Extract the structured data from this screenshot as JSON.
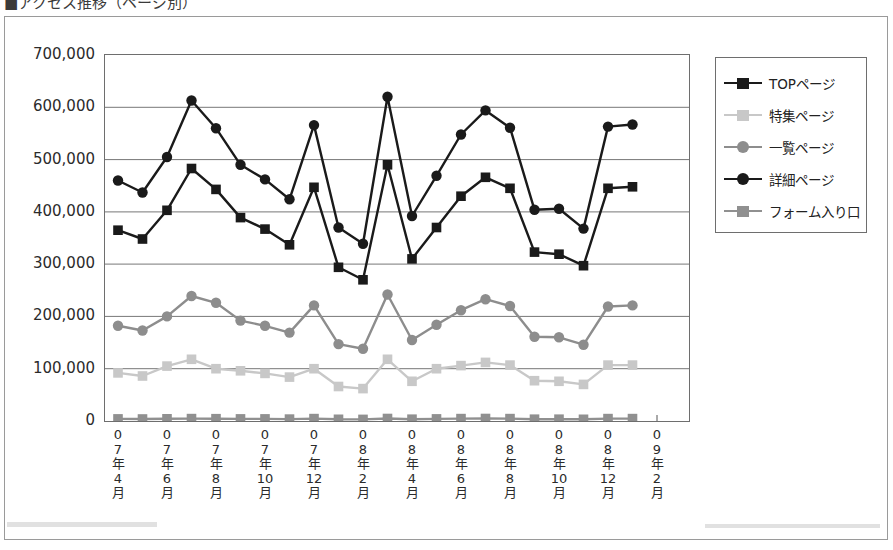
{
  "header": {
    "breadcrumb": "■アクセス推移（ページ別）"
  },
  "legend": {
    "position": "right",
    "items": [
      {
        "label": "TOPページ",
        "color": "#1a1a1a",
        "marker": "square"
      },
      {
        "label": "特集ページ",
        "color": "#c8c8c8",
        "marker": "square"
      },
      {
        "label": "一覧ページ",
        "color": "#8d8d8d",
        "marker": "circle"
      },
      {
        "label": "詳細ページ",
        "color": "#1a1a1a",
        "marker": "circle"
      },
      {
        "label": "フォーム入り口",
        "color": "#909090",
        "marker": "square"
      }
    ]
  },
  "chart_data": {
    "type": "line",
    "title": "",
    "xlabel": "",
    "ylabel": "",
    "ylim": [
      0,
      700000
    ],
    "ytick_step": 100000,
    "yticks": [
      "700,000",
      "600,000",
      "500,000",
      "400,000",
      "300,000",
      "200,000",
      "100,000",
      "0"
    ],
    "grid": true,
    "legend_position": "right",
    "x": [
      "07年4月",
      "07年5月",
      "07年6月",
      "07年7月",
      "07年8月",
      "07年9月",
      "07年10月",
      "07年11月",
      "07年12月",
      "08年1月",
      "08年2月",
      "08年3月",
      "08年4月",
      "08年5月",
      "08年6月",
      "08年7月",
      "08年8月",
      "08年9月",
      "08年10月",
      "08年11月",
      "08年12月",
      "09年1月"
    ],
    "xtick_labels": [
      "07年4月",
      "07年6月",
      "07年8月",
      "07年10月",
      "07年12月",
      "08年2月",
      "08年4月",
      "08年6月",
      "08年8月",
      "08年10月",
      "08年12月",
      "09年2月"
    ],
    "xtick_labels_vertical": [
      [
        "0",
        "7",
        "年",
        "4",
        "月"
      ],
      [
        "0",
        "7",
        "年",
        "6",
        "月"
      ],
      [
        "0",
        "7",
        "年",
        "8",
        "月"
      ],
      [
        "0",
        "7",
        "年",
        "10",
        "月"
      ],
      [
        "0",
        "7",
        "年",
        "12",
        "月"
      ],
      [
        "0",
        "8",
        "年",
        "2",
        "月"
      ],
      [
        "0",
        "8",
        "年",
        "4",
        "月"
      ],
      [
        "0",
        "8",
        "年",
        "6",
        "月"
      ],
      [
        "0",
        "8",
        "年",
        "8",
        "月"
      ],
      [
        "0",
        "8",
        "年",
        "10",
        "月"
      ],
      [
        "0",
        "8",
        "年",
        "12",
        "月"
      ],
      [
        "0",
        "9",
        "年",
        "2",
        "月"
      ]
    ],
    "series": [
      {
        "name": "TOPページ",
        "color": "#1a1a1a",
        "marker": "square",
        "values": [
          365000,
          348000,
          403000,
          483000,
          443000,
          389000,
          367000,
          337000,
          447000,
          294000,
          270000,
          490000,
          310000,
          370000,
          430000,
          466000,
          445000,
          323000,
          319000,
          297000,
          445000,
          448000
        ]
      },
      {
        "name": "特集ページ",
        "color": "#c8c8c8",
        "marker": "square",
        "values": [
          92000,
          86000,
          105000,
          118000,
          100000,
          96000,
          91000,
          84000,
          100000,
          66000,
          62000,
          118000,
          76000,
          100000,
          106000,
          112000,
          107000,
          77000,
          76000,
          70000,
          107000,
          107000
        ]
      },
      {
        "name": "一覧ページ",
        "color": "#8d8d8d",
        "marker": "circle",
        "values": [
          182000,
          173000,
          200000,
          239000,
          226000,
          192000,
          182000,
          169000,
          221000,
          147000,
          138000,
          242000,
          155000,
          184000,
          212000,
          233000,
          220000,
          161000,
          160000,
          146000,
          219000,
          221000
        ]
      },
      {
        "name": "詳細ページ",
        "color": "#1a1a1a",
        "marker": "circle",
        "values": [
          460000,
          437000,
          505000,
          613000,
          560000,
          490000,
          462000,
          424000,
          566000,
          370000,
          339000,
          620000,
          392000,
          469000,
          548000,
          594000,
          561000,
          404000,
          406000,
          368000,
          563000,
          567000
        ]
      },
      {
        "name": "フォーム入り口",
        "color": "#909090",
        "marker": "square",
        "values": [
          4000,
          3800,
          4200,
          4600,
          4400,
          4100,
          4000,
          3700,
          4500,
          3200,
          3000,
          4800,
          3400,
          4000,
          4500,
          4700,
          4500,
          3500,
          3500,
          3200,
          4500,
          4600
        ]
      }
    ]
  }
}
